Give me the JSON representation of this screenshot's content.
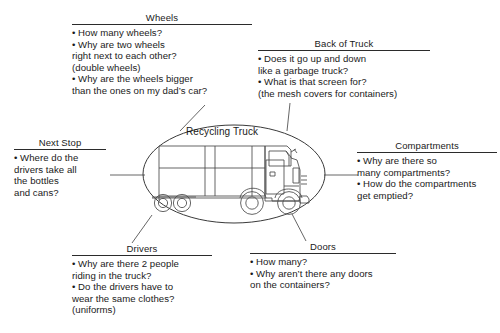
{
  "center": {
    "label": "Recycling Truck",
    "illustration_name": "recycling-truck-illustration"
  },
  "clusters": [
    {
      "id": "wheels",
      "heading": "Wheels",
      "lines": [
        "• How many wheels?",
        "• Why are two wheels",
        "right next to each other?",
        "(double wheels)",
        "• Why are the wheels bigger",
        "than the ones on my dad’s car?"
      ]
    },
    {
      "id": "back-of-truck",
      "heading": "Back of Truck",
      "lines": [
        "• Does it go up and down",
        "like a garbage truck?",
        "• What is that screen for?",
        "(the mesh covers for containers)"
      ]
    },
    {
      "id": "compartments",
      "heading": "Compartments",
      "lines": [
        "• Why are there so",
        "many compartments?",
        "• How do the compartments",
        "get emptied?"
      ]
    },
    {
      "id": "next-stop",
      "heading": "Next Stop",
      "lines": [
        "• Where do the",
        "drivers take all",
        "the bottles",
        "and cans?"
      ]
    },
    {
      "id": "drivers",
      "heading": "Drivers",
      "lines": [
        "• Why are there 2 people",
        "riding in the truck?",
        "• Do the drivers have to",
        "wear the same clothes?",
        "(uniforms)"
      ]
    },
    {
      "id": "doors",
      "heading": "Doors",
      "lines": [
        "• How many?",
        "• Why aren’t there any doors",
        "on the containers?"
      ]
    }
  ],
  "colors": {
    "ink": "#2b2b2b",
    "text": "#1a1a1a",
    "background": "#ffffff",
    "line": "#555555"
  }
}
